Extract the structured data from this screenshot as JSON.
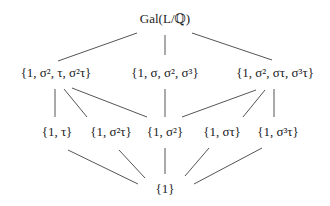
{
  "diagram": {
    "type": "subgroup-lattice",
    "nodes": [
      {
        "id": "G",
        "label": "Gal(L/ℚ)",
        "x": 165,
        "y": 18,
        "level": 0
      },
      {
        "id": "V1",
        "label": "{1, σ², τ, σ²τ}",
        "x": 56,
        "y": 72,
        "level": 1
      },
      {
        "id": "C4",
        "label": "{1, σ, σ², σ³}",
        "x": 165,
        "y": 72,
        "level": 1
      },
      {
        "id": "V2",
        "label": "{1, σ², στ, σ³τ}",
        "x": 275,
        "y": 72,
        "level": 1
      },
      {
        "id": "T1",
        "label": "{1, τ}",
        "x": 57,
        "y": 131,
        "level": 2
      },
      {
        "id": "T2",
        "label": "{1, σ²τ}",
        "x": 111,
        "y": 131,
        "level": 2
      },
      {
        "id": "S2",
        "label": "{1, σ²}",
        "x": 165,
        "y": 131,
        "level": 2
      },
      {
        "id": "T3",
        "label": "{1, στ}",
        "x": 222,
        "y": 131,
        "level": 2
      },
      {
        "id": "T4",
        "label": "{1, σ³τ}",
        "x": 278,
        "y": 131,
        "level": 2
      },
      {
        "id": "E",
        "label": "{1}",
        "x": 165,
        "y": 188,
        "level": 3
      }
    ],
    "edges": [
      {
        "from": "G",
        "to": "V1",
        "x1": 137,
        "y1": 33,
        "x2": 58,
        "y2": 61
      },
      {
        "from": "G",
        "to": "C4",
        "x1": 165,
        "y1": 35,
        "x2": 165,
        "y2": 55
      },
      {
        "from": "G",
        "to": "V2",
        "x1": 192,
        "y1": 33,
        "x2": 272,
        "y2": 60
      },
      {
        "from": "V1",
        "to": "T1",
        "x1": 55,
        "y1": 89,
        "x2": 55,
        "y2": 117
      },
      {
        "from": "V1",
        "to": "T2",
        "x1": 64,
        "y1": 89,
        "x2": 87,
        "y2": 117
      },
      {
        "from": "V1",
        "to": "S2",
        "x1": 72,
        "y1": 88,
        "x2": 147,
        "y2": 117
      },
      {
        "from": "C4",
        "to": "S2",
        "x1": 165,
        "y1": 89,
        "x2": 165,
        "y2": 117
      },
      {
        "from": "V2",
        "to": "S2",
        "x1": 256,
        "y1": 90,
        "x2": 182,
        "y2": 117
      },
      {
        "from": "V2",
        "to": "T3",
        "x1": 265,
        "y1": 90,
        "x2": 243,
        "y2": 117
      },
      {
        "from": "V2",
        "to": "T4",
        "x1": 274,
        "y1": 89,
        "x2": 274,
        "y2": 117
      },
      {
        "from": "T1",
        "to": "E",
        "x1": 68,
        "y1": 150,
        "x2": 138,
        "y2": 184
      },
      {
        "from": "T2",
        "to": "E",
        "x1": 119,
        "y1": 150,
        "x2": 145,
        "y2": 178
      },
      {
        "from": "S2",
        "to": "E",
        "x1": 165,
        "y1": 148,
        "x2": 165,
        "y2": 174
      },
      {
        "from": "T3",
        "to": "E",
        "x1": 209,
        "y1": 148,
        "x2": 185,
        "y2": 176
      },
      {
        "from": "T4",
        "to": "E",
        "x1": 262,
        "y1": 148,
        "x2": 194,
        "y2": 184
      }
    ],
    "colors": {
      "text": "#222222",
      "edge": "#555555",
      "background": "#ffffff"
    }
  }
}
